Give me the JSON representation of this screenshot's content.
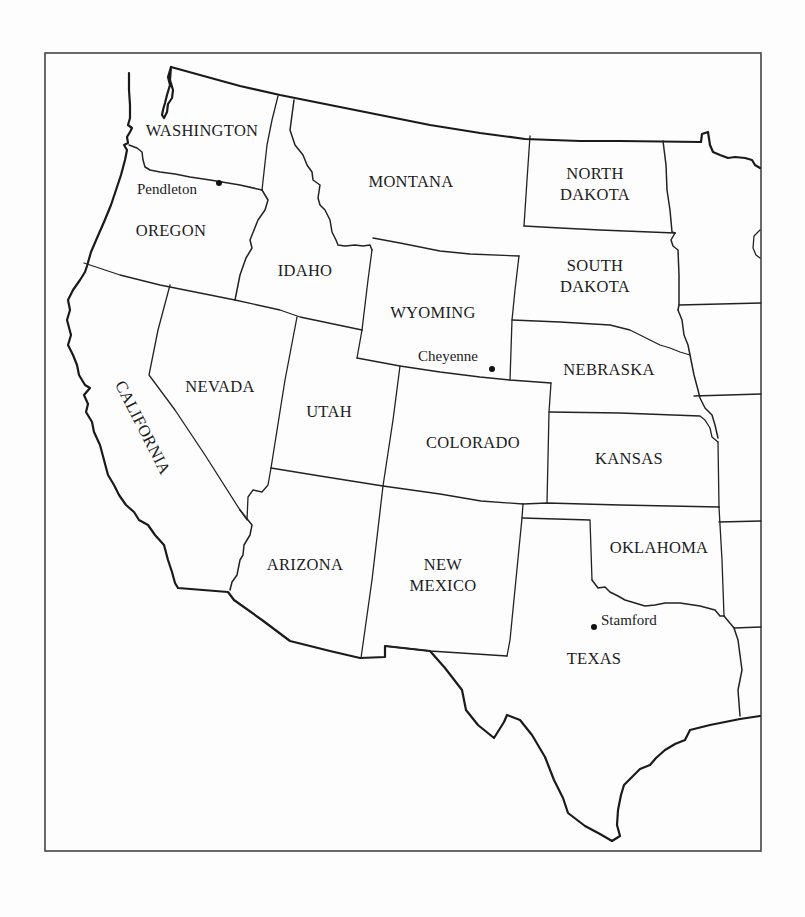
{
  "map": {
    "type": "political outline map",
    "region": "Western United States",
    "frame": {
      "x": 45,
      "y": 53,
      "width": 716,
      "height": 798
    },
    "states": [
      {
        "id": "washington",
        "label": [
          "WASHINGTON"
        ],
        "x": 202,
        "y": 136
      },
      {
        "id": "oregon",
        "label": [
          "OREGON"
        ],
        "x": 171,
        "y": 236
      },
      {
        "id": "idaho",
        "label": [
          "IDAHO"
        ],
        "x": 305,
        "y": 276
      },
      {
        "id": "montana",
        "label": [
          "MONTANA"
        ],
        "x": 411,
        "y": 187
      },
      {
        "id": "north-dakota",
        "label": [
          "NORTH",
          "DAKOTA"
        ],
        "x": 595,
        "y": 179
      },
      {
        "id": "south-dakota",
        "label": [
          "SOUTH",
          "DAKOTA"
        ],
        "x": 595,
        "y": 271
      },
      {
        "id": "wyoming",
        "label": [
          "WYOMING"
        ],
        "x": 433,
        "y": 318
      },
      {
        "id": "nebraska",
        "label": [
          "NEBRASKA"
        ],
        "x": 609,
        "y": 375
      },
      {
        "id": "nevada",
        "label": [
          "NEVADA"
        ],
        "x": 220,
        "y": 392
      },
      {
        "id": "utah",
        "label": [
          "UTAH"
        ],
        "x": 329,
        "y": 417
      },
      {
        "id": "california",
        "label": [
          "CALIFORNIA"
        ],
        "x": 138,
        "y": 430,
        "rotate": 63
      },
      {
        "id": "colorado",
        "label": [
          "COLORADO"
        ],
        "x": 473,
        "y": 448
      },
      {
        "id": "kansas",
        "label": [
          "KANSAS"
        ],
        "x": 629,
        "y": 464
      },
      {
        "id": "oklahoma",
        "label": [
          "OKLAHOMA"
        ],
        "x": 659,
        "y": 553
      },
      {
        "id": "arizona",
        "label": [
          "ARIZONA"
        ],
        "x": 305,
        "y": 570
      },
      {
        "id": "new-mexico",
        "label": [
          "NEW",
          "MEXICO"
        ],
        "x": 443,
        "y": 570
      },
      {
        "id": "texas",
        "label": [
          "TEXAS"
        ],
        "x": 594,
        "y": 664
      }
    ],
    "cities": [
      {
        "id": "pendleton",
        "name": "Pendleton",
        "dot_x": 219,
        "dot_y": 183,
        "label_x": 137,
        "label_y": 194,
        "anchor": "start"
      },
      {
        "id": "cheyenne",
        "name": "Cheyenne",
        "dot_x": 492,
        "dot_y": 369,
        "label_x": 418,
        "label_y": 361,
        "anchor": "start"
      },
      {
        "id": "stamford",
        "name": "Stamford",
        "dot_x": 594,
        "dot_y": 627,
        "label_x": 601,
        "label_y": 625,
        "anchor": "start"
      }
    ]
  }
}
